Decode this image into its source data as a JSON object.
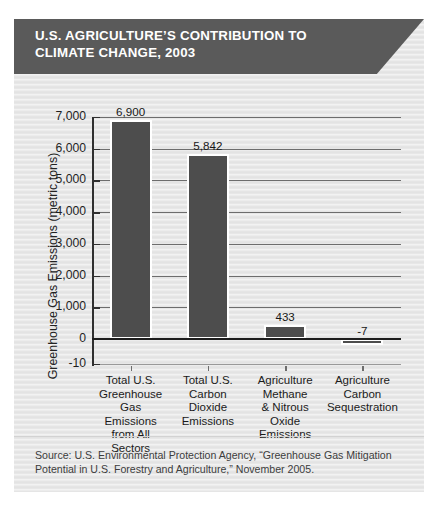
{
  "banner": {
    "title": "U.S. AGRICULTURE’S CONTRIBUTION TO CLIMATE CHANGE, 2003",
    "background_color": "#5a5a5a",
    "text_color": "#ffffff"
  },
  "panel": {
    "background_color": "#e9e9e9"
  },
  "source": {
    "text": "Source: U.S. Environmental Protection Agency, “Greenhouse Gas Mitigation Potential in U.S. Forestry and Agriculture,” November 2005."
  },
  "chart_data": {
    "type": "bar",
    "title": "U.S. AGRICULTURE’S CONTRIBUTION TO CLIMATE CHANGE, 2003",
    "xlabel": "",
    "ylabel": "Greenhouse Gas Emissions (metric tons)",
    "categories": [
      "Total U.S. Greenhouse Gas Emissions from All Sectors",
      "Total U.S. Carbon Dioxide Emissions",
      "Agriculture Methane & Nitrous Oxide Emissions",
      "Agriculture Carbon Sequestration"
    ],
    "category_lines": [
      [
        "Total U.S.",
        "Greenhouse",
        "Gas Emissions",
        "from All",
        "Sectors"
      ],
      [
        "Total U.S.",
        "Carbon",
        "Dioxide",
        "Emissions"
      ],
      [
        "Agriculture",
        "Methane",
        "& Nitrous",
        "Oxide",
        "Emissions"
      ],
      [
        "Agriculture",
        "Carbon",
        "Sequestration"
      ]
    ],
    "values": [
      6900,
      5842,
      433,
      -7
    ],
    "value_labels": [
      "6,900",
      "5,842",
      "433",
      "-7"
    ],
    "ylim": [
      -10,
      7000
    ],
    "yticks": [
      7000,
      6000,
      5000,
      4000,
      3000,
      2000,
      1000,
      0,
      -10
    ],
    "ytick_labels": [
      "7,000",
      "6,000",
      "5,000",
      "4,000",
      "3,000",
      "2,000",
      "1,000",
      "0",
      "-10"
    ],
    "grid": true,
    "legend": null,
    "bar_color": "#4d4d4d",
    "bar_border_color": "#ffffff",
    "zero_line_color": "#1d1d1d"
  }
}
